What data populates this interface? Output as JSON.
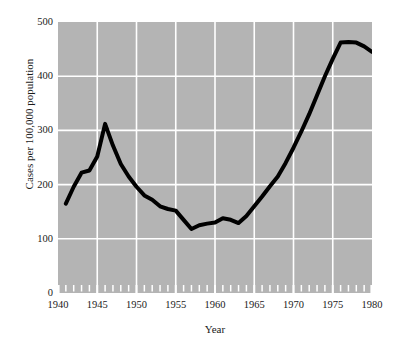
{
  "chart_data": {
    "type": "line",
    "title": "",
    "subtitle": "",
    "xlabel": "Year",
    "ylabel": "Cases per 100,000 population",
    "xlim": [
      1940,
      1980
    ],
    "ylim": [
      0,
      500
    ],
    "grid": true,
    "legend_position": "none",
    "x_major_ticks": [
      1940,
      1945,
      1950,
      1955,
      1960,
      1965,
      1970,
      1975,
      1980
    ],
    "x_major_tick_labels": [
      "1940",
      "1945",
      "1950",
      "1955",
      "1960",
      "1965",
      "1970",
      "1975",
      "1980"
    ],
    "x_minor_tick_step": 1,
    "y_major_ticks": [
      0,
      100,
      200,
      300,
      400,
      500
    ],
    "y_major_tick_labels": [
      "0",
      "100",
      "200",
      "300",
      "400",
      "500"
    ],
    "series": [
      {
        "name": "Cases per 100,000 population",
        "color": "#000000",
        "line_width": 4,
        "x": [
          1941,
          1942,
          1943,
          1944,
          1945,
          1946,
          1947,
          1948,
          1949,
          1950,
          1951,
          1952,
          1953,
          1954,
          1955,
          1956,
          1957,
          1958,
          1959,
          1960,
          1961,
          1962,
          1963,
          1964,
          1965,
          1966,
          1967,
          1968,
          1969,
          1970,
          1971,
          1972,
          1973,
          1974,
          1975,
          1976,
          1977,
          1978,
          1979,
          1980
        ],
        "values": [
          165,
          196,
          222,
          226,
          252,
          312,
          272,
          238,
          215,
          196,
          180,
          172,
          160,
          155,
          152,
          135,
          118,
          125,
          128,
          130,
          138,
          135,
          129,
          142,
          160,
          178,
          197,
          215,
          240,
          268,
          298,
          330,
          365,
          400,
          432,
          462,
          463,
          462,
          455,
          445
        ]
      }
    ]
  }
}
